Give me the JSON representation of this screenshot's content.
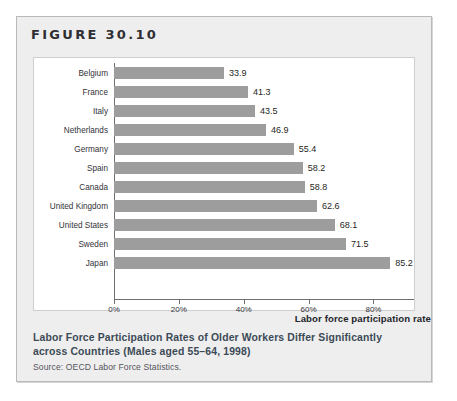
{
  "figure": {
    "number_label": "FIGURE 30.10",
    "caption": "Labor Force Participation Rates of Older Workers Differ Significantly across Countries (Males aged 55–64, 1998)",
    "source": "Source: OECD Labor Force Statistics.",
    "colors": {
      "bar": "#9d9d9d",
      "panel_background": "#ffffff",
      "box_background": "#eeeeee",
      "caption_text": "#3c4a57",
      "axis_line": "#6f6f6f"
    }
  },
  "chart_data": {
    "type": "bar",
    "orientation": "horizontal",
    "title": "",
    "xlabel": "Labor force participation rate",
    "ylabel": "",
    "categories": [
      "Belgium",
      "France",
      "Italy",
      "Netherlands",
      "Germany",
      "Spain",
      "Canada",
      "United Kingdom",
      "United States",
      "Sweden",
      "Japan"
    ],
    "values": [
      33.9,
      41.3,
      43.5,
      46.9,
      55.4,
      58.2,
      58.8,
      62.6,
      68.1,
      71.5,
      85.2
    ],
    "value_labels": [
      "33.9",
      "41.3",
      "43.5",
      "46.9",
      "55.4",
      "58.2",
      "58.8",
      "62.6",
      "68.1",
      "71.5",
      "85.2"
    ],
    "xlim": [
      0,
      92.5
    ],
    "xticks": [
      0,
      20,
      40,
      60,
      80
    ],
    "xtick_labels": [
      "0%",
      "20%",
      "40%",
      "60%",
      "80%"
    ],
    "grid": false,
    "legend": false,
    "units": "percent"
  }
}
